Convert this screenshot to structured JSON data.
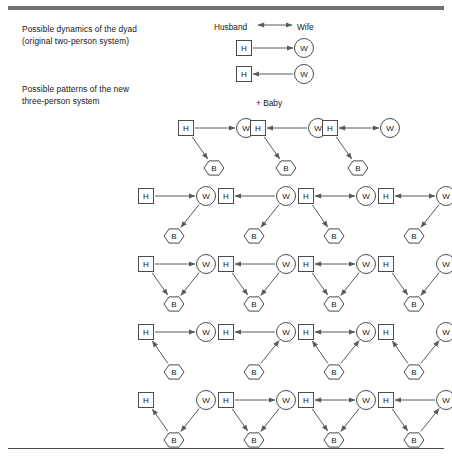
{
  "figure": {
    "captions": {
      "dyad": "Possible dynamics of the dyad\n(original two-person system)",
      "triad": "Possible patterns of the new\nthree-person system"
    },
    "legend": {
      "husband": "Husband",
      "wife": "Wife",
      "plus_baby": "+ Baby",
      "arrow": "double-headed-arrow"
    },
    "node_labels": {
      "husband": "H",
      "wife": "W",
      "baby": "B"
    },
    "colors": {
      "rule_top": "#6f7378",
      "rule_bottom": "#4a4a4a",
      "node_stroke": "#4c4c4c",
      "link_stroke": "#5a5a5a",
      "text": "#161616",
      "background": "#ffffff"
    }
  },
  "chart_data": {
    "type": "diagram",
    "node_shapes": {
      "H": "square",
      "W": "circle",
      "B": "hexagon"
    },
    "dyad_diagrams": [
      {
        "id": "dyad-1",
        "nodes": [
          "H",
          "W"
        ],
        "edges": [
          {
            "from": "H",
            "to": "W",
            "direction": "forward"
          }
        ]
      },
      {
        "id": "dyad-2",
        "nodes": [
          "H",
          "W"
        ],
        "edges": [
          {
            "from": "W",
            "to": "H",
            "direction": "forward"
          }
        ]
      }
    ],
    "triad_rows": [
      {
        "row": 1,
        "cells": [
          {
            "id": "r1c1",
            "edges": [
              {
                "from": "H",
                "to": "W",
                "direction": "forward"
              },
              {
                "from": "H",
                "to": "B",
                "direction": "forward"
              }
            ]
          },
          {
            "id": "r1c2",
            "edges": [
              {
                "from": "W",
                "to": "H",
                "direction": "forward"
              },
              {
                "from": "H",
                "to": "B",
                "direction": "forward"
              }
            ]
          },
          {
            "id": "r1c3",
            "edges": [
              {
                "from": "H",
                "to": "W",
                "direction": "both"
              },
              {
                "from": "H",
                "to": "B",
                "direction": "forward"
              }
            ]
          }
        ]
      },
      {
        "row": 2,
        "cells": [
          {
            "id": "r2c1",
            "edges": [
              {
                "from": "H",
                "to": "W",
                "direction": "forward"
              },
              {
                "from": "W",
                "to": "B",
                "direction": "forward"
              }
            ]
          },
          {
            "id": "r2c2",
            "edges": [
              {
                "from": "W",
                "to": "H",
                "direction": "forward"
              },
              {
                "from": "W",
                "to": "B",
                "direction": "forward"
              }
            ]
          },
          {
            "id": "r2c3",
            "edges": [
              {
                "from": "H",
                "to": "W",
                "direction": "both"
              },
              {
                "from": "H",
                "to": "B",
                "direction": "forward"
              }
            ]
          },
          {
            "id": "r2c4",
            "edges": [
              {
                "from": "H",
                "to": "W",
                "direction": "both"
              },
              {
                "from": "W",
                "to": "B",
                "direction": "forward"
              }
            ]
          }
        ]
      },
      {
        "row": 3,
        "cells": [
          {
            "id": "r3c1",
            "edges": [
              {
                "from": "H",
                "to": "W",
                "direction": "forward"
              },
              {
                "from": "H",
                "to": "B",
                "direction": "forward"
              },
              {
                "from": "W",
                "to": "B",
                "direction": "forward"
              }
            ]
          },
          {
            "id": "r3c2",
            "edges": [
              {
                "from": "W",
                "to": "H",
                "direction": "forward"
              },
              {
                "from": "H",
                "to": "B",
                "direction": "forward"
              },
              {
                "from": "W",
                "to": "B",
                "direction": "forward"
              }
            ]
          },
          {
            "id": "r3c3",
            "edges": [
              {
                "from": "H",
                "to": "W",
                "direction": "both"
              },
              {
                "from": "H",
                "to": "B",
                "direction": "forward"
              },
              {
                "from": "W",
                "to": "B",
                "direction": "forward"
              }
            ]
          },
          {
            "id": "r3c4",
            "edges": [
              {
                "from": "H",
                "to": "B",
                "direction": "forward"
              },
              {
                "from": "W",
                "to": "B",
                "direction": "forward"
              }
            ]
          }
        ]
      },
      {
        "row": 4,
        "cells": [
          {
            "id": "r4c1",
            "edges": [
              {
                "from": "H",
                "to": "W",
                "direction": "forward"
              },
              {
                "from": "B",
                "to": "H",
                "direction": "forward"
              }
            ]
          },
          {
            "id": "r4c2",
            "edges": [
              {
                "from": "W",
                "to": "H",
                "direction": "forward"
              },
              {
                "from": "B",
                "to": "W",
                "direction": "forward"
              }
            ]
          },
          {
            "id": "r4c3",
            "edges": [
              {
                "from": "H",
                "to": "W",
                "direction": "both"
              },
              {
                "from": "B",
                "to": "H",
                "direction": "forward"
              },
              {
                "from": "B",
                "to": "W",
                "direction": "forward"
              }
            ]
          },
          {
            "id": "r4c4",
            "edges": [
              {
                "from": "B",
                "to": "H",
                "direction": "forward"
              },
              {
                "from": "B",
                "to": "W",
                "direction": "forward"
              }
            ]
          }
        ]
      },
      {
        "row": 5,
        "cells": [
          {
            "id": "r5c1",
            "edges": [
              {
                "from": "B",
                "to": "H",
                "direction": "forward"
              },
              {
                "from": "W",
                "to": "B",
                "direction": "forward"
              }
            ]
          },
          {
            "id": "r5c2",
            "edges": [
              {
                "from": "H",
                "to": "W",
                "direction": "forward"
              },
              {
                "from": "H",
                "to": "B",
                "direction": "forward"
              },
              {
                "from": "W",
                "to": "B",
                "direction": "forward"
              }
            ]
          },
          {
            "id": "r5c3",
            "edges": [
              {
                "from": "H",
                "to": "W",
                "direction": "both"
              },
              {
                "from": "H",
                "to": "B",
                "direction": "forward"
              },
              {
                "from": "W",
                "to": "B",
                "direction": "forward"
              }
            ]
          },
          {
            "id": "r5c4",
            "edges": [
              {
                "from": "W",
                "to": "H",
                "direction": "forward"
              },
              {
                "from": "H",
                "to": "B",
                "direction": "forward"
              },
              {
                "from": "B",
                "to": "W",
                "direction": "forward"
              }
            ]
          }
        ]
      }
    ]
  },
  "layout": {
    "dyad_origins": [
      {
        "x": 244,
        "y": 48
      },
      {
        "x": 244,
        "y": 74
      }
    ],
    "triad_rows": [
      {
        "y": 128,
        "xs": [
          186,
          258,
          330
        ]
      },
      {
        "y": 196,
        "xs": [
          146,
          226,
          306,
          386
        ]
      },
      {
        "y": 264,
        "xs": [
          146,
          226,
          306,
          386
        ]
      },
      {
        "y": 332,
        "xs": [
          146,
          226,
          306,
          386
        ]
      },
      {
        "y": 400,
        "xs": [
          146,
          226,
          306,
          386
        ]
      }
    ]
  }
}
